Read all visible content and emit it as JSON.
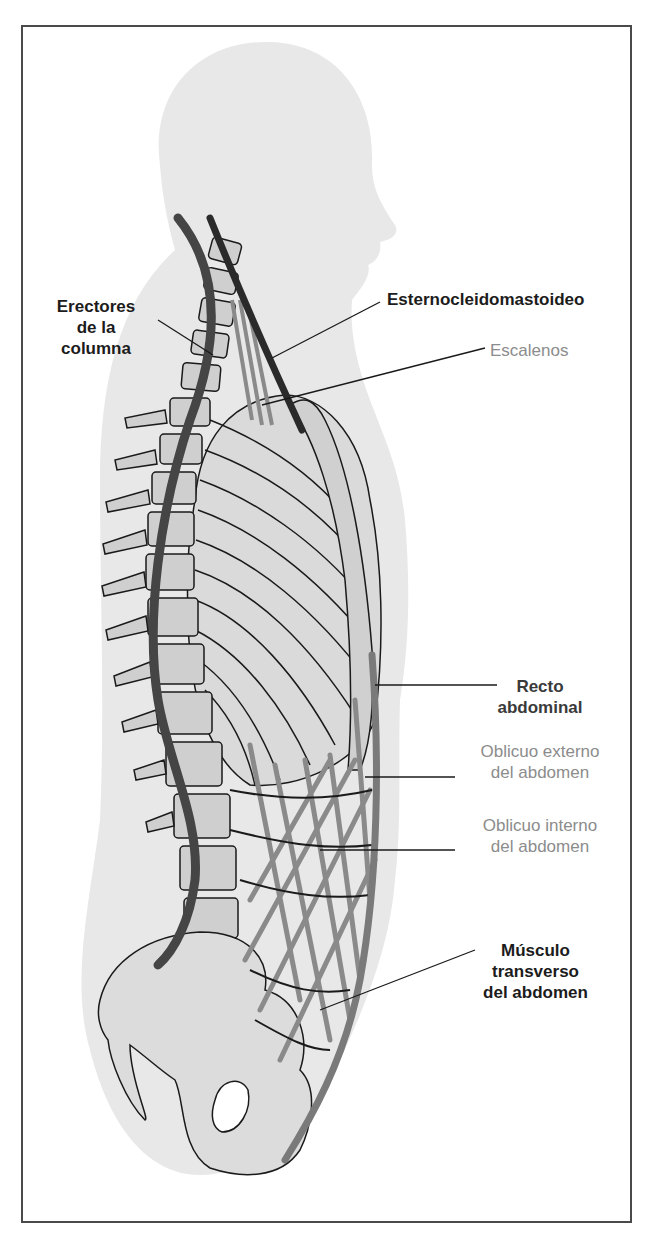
{
  "figure": {
    "colors": {
      "silhouette": "#e6e6e6",
      "bone_fill": "#d6d6d6",
      "bone_outline": "#1a1a1a",
      "erector_muscle": "#444444",
      "scm_muscle": "#2a2a2a",
      "gray_muscle": "#8a8a8a",
      "label_dark": "#1c1c1c",
      "label_gray": "#8c8c8c"
    }
  },
  "labels": {
    "erectores": {
      "line1": "Erectores",
      "line2": "de la",
      "line3": "columna"
    },
    "esternocleidomastoideo": {
      "text": "Esternocleidomastoideo"
    },
    "escalenos": {
      "text": "Escalenos"
    },
    "recto": {
      "line1": "Recto",
      "line2": "abdominal"
    },
    "oblicuo_externo": {
      "line1": "Oblicuo externo",
      "line2": "del abdomen"
    },
    "oblicuo_interno": {
      "line1": "Oblicuo interno",
      "line2": "del abdomen"
    },
    "transverso": {
      "line1": "Músculo",
      "line2": "transverso",
      "line3": "del abdomen"
    }
  }
}
